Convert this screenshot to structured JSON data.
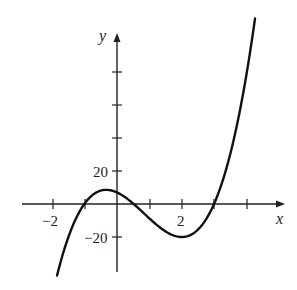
{
  "chart_data": {
    "type": "line",
    "title": "",
    "xlabel": "x",
    "ylabel": "y",
    "x_tick_labels": [
      "-2",
      "2"
    ],
    "y_tick_labels": [
      "20",
      "-20"
    ],
    "x_ticks": [
      -2,
      -1,
      0,
      1,
      2,
      3,
      4
    ],
    "y_ticks": [
      -20,
      20,
      40,
      60,
      80
    ],
    "xlim": [
      -3,
      4.5
    ],
    "ylim": [
      -40,
      110
    ],
    "grid": false,
    "series": [
      {
        "name": "cubic",
        "x": [
          -1.85,
          -1.5,
          -1.2,
          -1,
          -0.5,
          -0.33,
          0,
          0.4,
          1,
          1.5,
          2,
          2.5,
          3,
          3.5,
          4,
          4.26
        ],
        "y": [
          -40,
          -17,
          -2.5,
          2.5,
          8.4,
          8.6,
          7,
          1.5,
          -8.75,
          -15.6,
          -20,
          -14.9,
          0.25,
          25.6,
          61,
          100
        ]
      }
    ]
  },
  "labels": {
    "x_axis": "x",
    "y_axis": "y",
    "x_neg2": "−2",
    "x_2": "2",
    "y_20": "20",
    "y_neg20": "−20"
  }
}
